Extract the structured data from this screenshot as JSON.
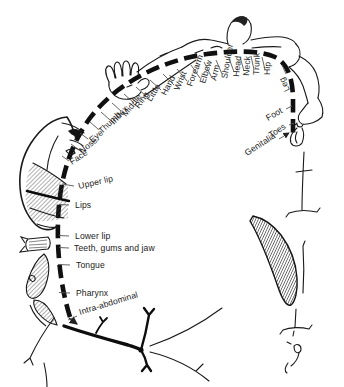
{
  "colors": {
    "ink": "#1a1a1a",
    "paper": "#ffffff"
  },
  "labels": [
    {
      "id": "intra_abdominal",
      "text": "Intra-abdominal"
    },
    {
      "id": "pharynx",
      "text": "Pharynx"
    },
    {
      "id": "tongue",
      "text": "Tongue"
    },
    {
      "id": "teeth_gums_jaw",
      "text": "Teeth, gums and jaw"
    },
    {
      "id": "lower_lip",
      "text": "Lower lip"
    },
    {
      "id": "lips",
      "text": "Lips"
    },
    {
      "id": "upper_lip",
      "text": "Upper lip"
    },
    {
      "id": "face",
      "text": "Face"
    },
    {
      "id": "nose",
      "text": "Nose"
    },
    {
      "id": "eye",
      "text": "Eye"
    },
    {
      "id": "thumb",
      "text": "Thumb"
    },
    {
      "id": "index",
      "text": "Index"
    },
    {
      "id": "middle",
      "text": "Middle"
    },
    {
      "id": "ring",
      "text": "Ring"
    },
    {
      "id": "little",
      "text": "Little"
    },
    {
      "id": "hand",
      "text": "Hand"
    },
    {
      "id": "wrist",
      "text": "Wrist"
    },
    {
      "id": "forearm",
      "text": "Forearm"
    },
    {
      "id": "elbow",
      "text": "Elbow"
    },
    {
      "id": "arm",
      "text": "Arm"
    },
    {
      "id": "shoulder",
      "text": "Shoulder"
    },
    {
      "id": "head",
      "text": "Head"
    },
    {
      "id": "neck",
      "text": "Neck"
    },
    {
      "id": "trunk",
      "text": "Trunk"
    },
    {
      "id": "hip",
      "text": "Hip"
    },
    {
      "id": "leg",
      "text": "Leg"
    },
    {
      "id": "foot",
      "text": "Foot"
    },
    {
      "id": "toes",
      "text": "Toes"
    },
    {
      "id": "genitalia",
      "text": "Genitalia"
    }
  ]
}
